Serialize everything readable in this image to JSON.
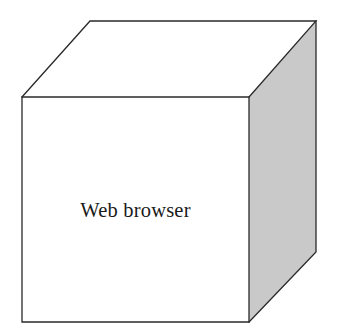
{
  "diagram": {
    "type": "3d-cube",
    "canvas": {
      "width": 338,
      "height": 334
    },
    "background_color": "#ffffff",
    "label": "Web browser",
    "label_color": "#1a1a1a",
    "edge_color": "#2a2a2a",
    "faces": {
      "front": {
        "name": "front-face",
        "fill": "#ffffff",
        "points": "22,97 249,97 249,322 22,322"
      },
      "top": {
        "name": "top-face",
        "fill": "#ffffff",
        "points": "22,97 90,21 316,21 249,97"
      },
      "right": {
        "name": "right-face",
        "fill": "#c9c9c9",
        "points": "249,97 316,21 316,252 249,322"
      }
    },
    "edges": {
      "front_outline": "M22,97 L249,97 L249,322 L22,322 Z",
      "top_outline": "M22,97 L90,21 L316,21 L249,97",
      "right_outline": "M316,21 L316,252 L249,322"
    }
  }
}
